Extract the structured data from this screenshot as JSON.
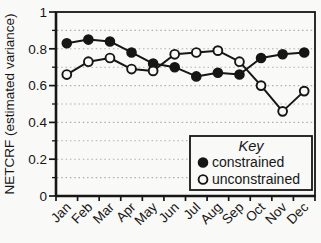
{
  "figure": {
    "background": "#f9f9f7",
    "ink_color": "#161616",
    "grid_color": "#aeaeae"
  },
  "chart_data": {
    "type": "line",
    "title": "",
    "xlabel": "",
    "ylabel": "NETCRF (estimated variance)",
    "categories": [
      "Jan",
      "Feb",
      "Mar",
      "Apr",
      "May",
      "Jun",
      "Jul",
      "Aug",
      "Sep",
      "Oct",
      "Nov",
      "Dec"
    ],
    "series": [
      {
        "name": "constrained",
        "marker": "filled-circle",
        "values": [
          0.83,
          0.85,
          0.84,
          0.78,
          0.72,
          0.7,
          0.65,
          0.67,
          0.66,
          0.75,
          0.77,
          0.78
        ]
      },
      {
        "name": "unconstrained",
        "marker": "open-circle",
        "values": [
          0.66,
          0.73,
          0.75,
          0.69,
          0.68,
          0.77,
          0.78,
          0.79,
          0.73,
          0.6,
          0.46,
          0.57
        ]
      }
    ],
    "ylim": [
      0,
      1
    ],
    "ytick_values": [
      0,
      0.2,
      0.4,
      0.6,
      0.8,
      1
    ],
    "ytick_labels": [
      "0",
      "0.2",
      "0.4",
      "0.6",
      "0.8",
      "1"
    ],
    "minor_ytick_step": 0.1,
    "grid": "horizontal-dotted-every-0.1",
    "legend": {
      "title": "Key",
      "position": "inside-lower-right"
    }
  }
}
